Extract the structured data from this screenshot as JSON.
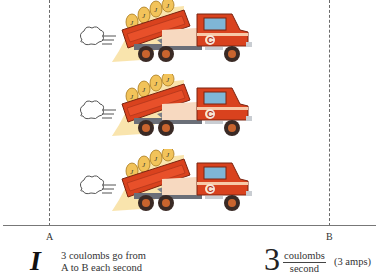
{
  "diagram": {
    "points": {
      "left": "A",
      "right": "B"
    },
    "truck_count": 3,
    "truck": {
      "bed_load_label": "J",
      "cab_logo": "C",
      "colors": {
        "body": "#d9421e",
        "bed_inner": "#e8502a",
        "stripe": "#f7c9a8",
        "chassis": "#6b6f78",
        "wheel": "#3a2a25",
        "hub": "#c8642e",
        "window": "#7fb6d6",
        "load_glow": "#f6d98a"
      }
    }
  },
  "caption": {
    "symbol": "I",
    "description_line1": "3 coulombs go from",
    "description_line2": "A to B each second",
    "value": "3",
    "unit_numerator": "coulombs",
    "unit_denominator": "second",
    "equivalent": "(3 amps)"
  }
}
